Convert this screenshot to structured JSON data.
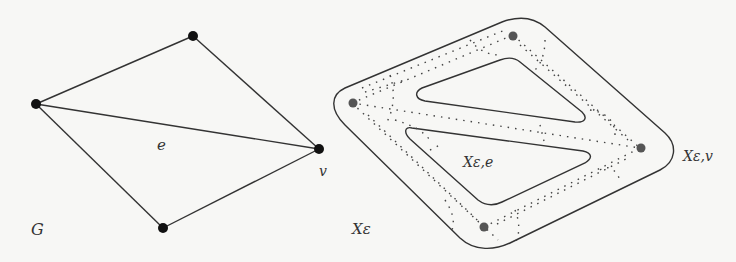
{
  "left_figure": {
    "name": "graph-G",
    "vertices": [
      {
        "id": "a",
        "x": 36,
        "y": 104
      },
      {
        "id": "b",
        "x": 193,
        "y": 36
      },
      {
        "id": "v",
        "x": 319,
        "y": 149
      },
      {
        "id": "c",
        "x": 163,
        "y": 228
      }
    ],
    "edges": [
      [
        "a",
        "b"
      ],
      [
        "b",
        "v"
      ],
      [
        "a",
        "v"
      ],
      [
        "a",
        "c"
      ],
      [
        "c",
        "v"
      ]
    ],
    "labels": {
      "edge": "e",
      "vertex": "v",
      "graph": "G"
    }
  },
  "right_figure": {
    "name": "thickened-space",
    "vertices": [
      {
        "x": 352,
        "y": 103
      },
      {
        "x": 513,
        "y": 35
      },
      {
        "x": 640,
        "y": 148
      },
      {
        "x": 484,
        "y": 227
      }
    ],
    "labels": {
      "space": "Xε",
      "edge_region": "Xε,e",
      "vertex_region": "Xε,v"
    }
  },
  "colors": {
    "line": "#333333",
    "vertex": "#111111",
    "vertex_gray": "#555555",
    "background": "#f7f7f5"
  }
}
